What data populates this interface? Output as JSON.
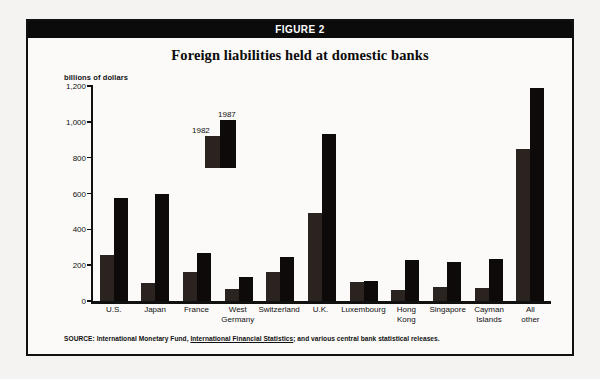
{
  "figure": {
    "banner_label": "FIGURE 2",
    "title": "Foreign liabilities held at domestic banks",
    "source_prefix": "SOURCE: International Monetary Fund, ",
    "source_publication": "International Financial Statistics",
    "source_suffix": "; and various central bank statistical releases."
  },
  "legend": {
    "series_1_label": "1982",
    "series_2_label": "1987"
  },
  "chart_data": {
    "type": "bar",
    "title": "Foreign liabilities held at domestic banks",
    "xlabel": "",
    "ylabel": "billions of dollars",
    "ylim": [
      0,
      1200
    ],
    "yticks": [
      0,
      200,
      400,
      600,
      800,
      1000,
      1200
    ],
    "ytick_labels": [
      "0",
      "200",
      "400",
      "600",
      "800",
      "1,000",
      "1,200"
    ],
    "grid": false,
    "legend_position": "inside-upper-left",
    "categories": [
      "U.S.",
      "Japan",
      "France",
      "West Germany",
      "Switzerland",
      "U.K.",
      "Luxembourg",
      "Hong Kong",
      "Singapore",
      "Cayman Islands",
      "All other"
    ],
    "category_lines": [
      [
        "U.S."
      ],
      [
        "Japan"
      ],
      [
        "France"
      ],
      [
        "West",
        "Germany"
      ],
      [
        "Switzerland"
      ],
      [
        "U.K."
      ],
      [
        "Luxembourg"
      ],
      [
        "Hong",
        "Kong"
      ],
      [
        "Singapore"
      ],
      [
        "Cayman",
        "Islands"
      ],
      [
        "All",
        "other"
      ]
    ],
    "series": [
      {
        "name": "1982",
        "color": "#2b2320",
        "values": [
          255,
          100,
          160,
          65,
          160,
          490,
          105,
          60,
          80,
          75,
          850
        ]
      },
      {
        "name": "1987",
        "color": "#0d0a09",
        "values": [
          575,
          595,
          270,
          135,
          245,
          930,
          110,
          230,
          215,
          235,
          1190
        ]
      }
    ]
  }
}
